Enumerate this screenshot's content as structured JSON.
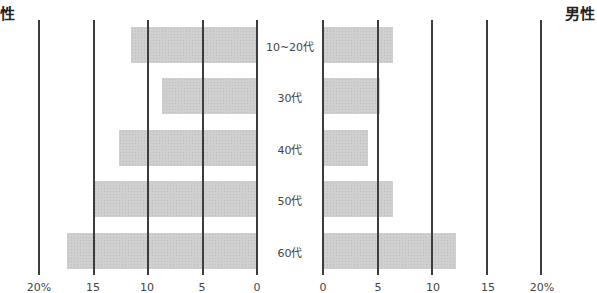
{
  "chart_data": {
    "type": "bar",
    "orientation": "horizontal-butterfly",
    "title": "",
    "panel_titles": {
      "left": "女性",
      "right": "男性"
    },
    "visible_panel_titles": {
      "left": "性",
      "right": "男性"
    },
    "categories": [
      "10~20代",
      "30代",
      "40代",
      "50代",
      "60代"
    ],
    "series": [
      {
        "name": "女性",
        "side": "left",
        "values": [
          11.6,
          8.7,
          12.7,
          15.0,
          17.4
        ]
      },
      {
        "name": "男性",
        "side": "right",
        "values": [
          6.4,
          5.2,
          4.1,
          6.4,
          12.2
        ]
      }
    ],
    "xlabel": "",
    "ylabel": "",
    "xlim": [
      0,
      20
    ],
    "unit": "%",
    "left_ticks": [
      "20%",
      "15",
      "10",
      "5",
      "0"
    ],
    "right_ticks": [
      "0",
      "5",
      "10",
      "15",
      "20%"
    ],
    "grid": true,
    "legend": "none",
    "bar_color": "#cfcfcf",
    "grid_color": "#3c3c3c"
  },
  "labels": {
    "left_title": "性",
    "right_title": "男性",
    "cat0": "10~20代",
    "cat1": "30代",
    "cat2": "40代",
    "cat3": "50代",
    "cat4": "60代",
    "lt0": "20%",
    "lt1": "15",
    "lt2": "10",
    "lt3": "5",
    "lt4": "0",
    "rt0": "0",
    "rt1": "5",
    "rt2": "10",
    "rt3": "15",
    "rt4": "20%"
  }
}
